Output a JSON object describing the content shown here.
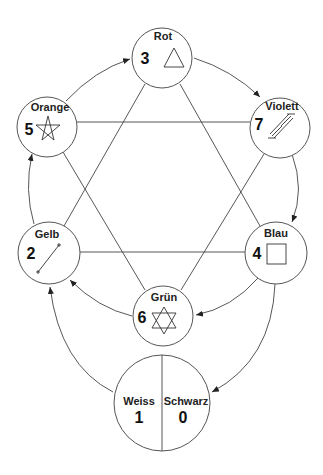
{
  "diagram": {
    "title": "",
    "nodes": [
      {
        "id": "rot",
        "label": "Rot",
        "number": "3",
        "symbol": "triangle"
      },
      {
        "id": "orange",
        "label": "Orange",
        "number": "5",
        "symbol": "pentagram"
      },
      {
        "id": "violett",
        "label": "Violett",
        "number": "7",
        "symbol": "ladder"
      },
      {
        "id": "gelb",
        "label": "Gelb",
        "number": "2",
        "symbol": "line-segment"
      },
      {
        "id": "blau",
        "label": "Blau",
        "number": "4",
        "symbol": "square"
      },
      {
        "id": "gruen",
        "label": "Grün",
        "number": "6",
        "symbol": "hexagram"
      },
      {
        "id": "weiss",
        "label": "Weiss",
        "number": "1",
        "symbol": "none"
      },
      {
        "id": "schwarz",
        "label": "Schwarz",
        "number": "0",
        "symbol": "none"
      }
    ],
    "arrows": [
      {
        "from": "Orange",
        "to": "Rot"
      },
      {
        "from": "Rot",
        "to": "Violett"
      },
      {
        "from": "Violett",
        "to": "Blau"
      },
      {
        "from": "Blau",
        "to": "Grün"
      },
      {
        "from": "Grün",
        "to": "Gelb"
      },
      {
        "from": "Gelb",
        "to": "Orange"
      },
      {
        "from": "Blau",
        "to": "Schwarz"
      },
      {
        "from": "Weiss",
        "to": "Gelb"
      }
    ],
    "lines": [
      {
        "a": "Orange",
        "b": "Violett"
      },
      {
        "a": "Gelb",
        "b": "Blau"
      },
      {
        "a": "Rot",
        "b": "Gelb"
      },
      {
        "a": "Rot",
        "b": "Blau"
      },
      {
        "a": "Orange",
        "b": "Grün"
      },
      {
        "a": "Violett",
        "b": "Grün"
      }
    ]
  }
}
